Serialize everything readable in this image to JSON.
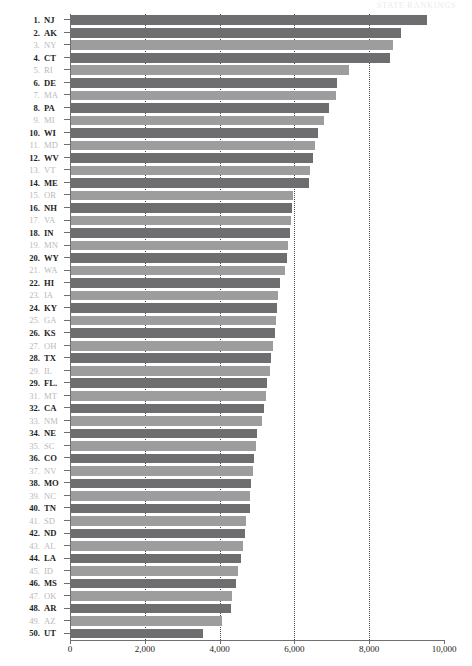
{
  "header": {
    "faint_text": "STATE RANKINGS"
  },
  "chart_data": {
    "type": "bar",
    "orientation": "horizontal",
    "title": "",
    "subtitle": "",
    "xlabel": "",
    "ylabel": "",
    "xlim": [
      0,
      10000
    ],
    "xticks": [
      0,
      2000,
      4000,
      6000,
      8000,
      10000
    ],
    "xticklabels": [
      "0",
      "2,000",
      "4,000",
      "6,000",
      "8,000",
      "10,000"
    ],
    "grid": "vertical-dotted",
    "legend": "none",
    "bar_colors": {
      "even_rank": "#6e6e70",
      "odd_rank": "#9d9d9e"
    },
    "categories": [
      "NJ",
      "AK",
      "NY",
      "CT",
      "RI",
      "DE",
      "MA",
      "PA",
      "MI",
      "WI",
      "MD",
      "WV",
      "VT",
      "ME",
      "OR",
      "NH",
      "VA",
      "IN",
      "MN",
      "WY",
      "WA",
      "HI",
      "IA",
      "KY",
      "GA",
      "KS",
      "OH",
      "TX",
      "IL",
      "FL",
      "MT",
      "CA",
      "NM",
      "NE",
      "SC",
      "CO",
      "NV",
      "MO",
      "NC",
      "TN",
      "SD",
      "ND",
      "AL",
      "LA",
      "ID",
      "MS",
      "OK",
      "AR",
      "AZ",
      "UT"
    ],
    "values": [
      9545,
      8850,
      8640,
      8545,
      7460,
      7140,
      7110,
      6930,
      6780,
      6620,
      6540,
      6500,
      6420,
      6380,
      5960,
      5940,
      5900,
      5890,
      5840,
      5790,
      5750,
      5620,
      5560,
      5540,
      5500,
      5470,
      5420,
      5370,
      5340,
      5280,
      5230,
      5190,
      5130,
      5000,
      4960,
      4920,
      4880,
      4850,
      4820,
      4800,
      4710,
      4680,
      4620,
      4560,
      4490,
      4440,
      4340,
      4310,
      4070,
      3560
    ],
    "ranks": [
      "1.",
      "2.",
      "3.",
      "4.",
      "5.",
      "6.",
      "7.",
      "8.",
      "9.",
      "10.",
      "11.",
      "12.",
      "13.",
      "14.",
      "15.",
      "16.",
      "17.",
      "18.",
      "19.",
      "20.",
      "21.",
      "22.",
      "23.",
      "24.",
      "25.",
      "26.",
      "27.",
      "28.",
      "29.",
      "29.",
      "31.",
      "32.",
      "33.",
      "34.",
      "35.",
      "36.",
      "37.",
      "38.",
      "39.",
      "40.",
      "41.",
      "42.",
      "43.",
      "44.",
      "45.",
      "46.",
      "47.",
      "48.",
      "49.",
      "50."
    ],
    "rows": [
      {
        "rank": "1.",
        "abbr": "NJ",
        "value": 9545,
        "emphasis": "bold"
      },
      {
        "rank": "2.",
        "abbr": "AK",
        "value": 8850,
        "emphasis": "bold"
      },
      {
        "rank": "3.",
        "abbr": "NY",
        "value": 8640,
        "emphasis": "light"
      },
      {
        "rank": "4.",
        "abbr": "CT",
        "value": 8545,
        "emphasis": "bold"
      },
      {
        "rank": "5.",
        "abbr": "RI",
        "value": 7460,
        "emphasis": "light"
      },
      {
        "rank": "6.",
        "abbr": "DE",
        "value": 7140,
        "emphasis": "bold"
      },
      {
        "rank": "7.",
        "abbr": "MA",
        "value": 7110,
        "emphasis": "light"
      },
      {
        "rank": "8.",
        "abbr": "PA",
        "value": 6930,
        "emphasis": "bold"
      },
      {
        "rank": "9.",
        "abbr": "MI",
        "value": 6780,
        "emphasis": "light"
      },
      {
        "rank": "10.",
        "abbr": "WI",
        "value": 6620,
        "emphasis": "bold"
      },
      {
        "rank": "11.",
        "abbr": "MD",
        "value": 6540,
        "emphasis": "light"
      },
      {
        "rank": "12.",
        "abbr": "WV",
        "value": 6500,
        "emphasis": "bold"
      },
      {
        "rank": "13.",
        "abbr": "VT",
        "value": 6420,
        "emphasis": "light"
      },
      {
        "rank": "14.",
        "abbr": "ME",
        "value": 6380,
        "emphasis": "bold"
      },
      {
        "rank": "15.",
        "abbr": "OR",
        "value": 5960,
        "emphasis": "light"
      },
      {
        "rank": "16.",
        "abbr": "NH",
        "value": 5940,
        "emphasis": "bold"
      },
      {
        "rank": "17.",
        "abbr": "VA",
        "value": 5900,
        "emphasis": "light"
      },
      {
        "rank": "18.",
        "abbr": "IN",
        "value": 5890,
        "emphasis": "bold"
      },
      {
        "rank": "19.",
        "abbr": "MN",
        "value": 5840,
        "emphasis": "light"
      },
      {
        "rank": "20.",
        "abbr": "WY",
        "value": 5790,
        "emphasis": "bold"
      },
      {
        "rank": "21.",
        "abbr": "WA",
        "value": 5750,
        "emphasis": "light"
      },
      {
        "rank": "22.",
        "abbr": "HI",
        "value": 5620,
        "emphasis": "bold"
      },
      {
        "rank": "23.",
        "abbr": "IA",
        "value": 5560,
        "emphasis": "light"
      },
      {
        "rank": "24.",
        "abbr": "KY",
        "value": 5540,
        "emphasis": "bold"
      },
      {
        "rank": "25.",
        "abbr": "GA",
        "value": 5500,
        "emphasis": "light"
      },
      {
        "rank": "26.",
        "abbr": "KS",
        "value": 5470,
        "emphasis": "bold"
      },
      {
        "rank": "27.",
        "abbr": "OH",
        "value": 5420,
        "emphasis": "light"
      },
      {
        "rank": "28.",
        "abbr": "TX",
        "value": 5370,
        "emphasis": "bold"
      },
      {
        "rank": "29.",
        "abbr": "IL",
        "value": 5340,
        "emphasis": "light"
      },
      {
        "rank": "29.",
        "abbr": "FL.",
        "value": 5280,
        "emphasis": "bold"
      },
      {
        "rank": "31.",
        "abbr": "MT",
        "value": 5230,
        "emphasis": "light"
      },
      {
        "rank": "32.",
        "abbr": "CA",
        "value": 5190,
        "emphasis": "bold"
      },
      {
        "rank": "33.",
        "abbr": "NM",
        "value": 5130,
        "emphasis": "light"
      },
      {
        "rank": "34.",
        "abbr": "NE",
        "value": 5000,
        "emphasis": "bold"
      },
      {
        "rank": "35.",
        "abbr": "SC",
        "value": 4960,
        "emphasis": "light"
      },
      {
        "rank": "36.",
        "abbr": "CO",
        "value": 4920,
        "emphasis": "bold"
      },
      {
        "rank": "37.",
        "abbr": "NV",
        "value": 4880,
        "emphasis": "light"
      },
      {
        "rank": "38.",
        "abbr": "MO",
        "value": 4850,
        "emphasis": "bold"
      },
      {
        "rank": "39.",
        "abbr": "NC",
        "value": 4820,
        "emphasis": "light"
      },
      {
        "rank": "40.",
        "abbr": "TN",
        "value": 4800,
        "emphasis": "bold"
      },
      {
        "rank": "41.",
        "abbr": "SD",
        "value": 4710,
        "emphasis": "light"
      },
      {
        "rank": "42.",
        "abbr": "ND",
        "value": 4680,
        "emphasis": "bold"
      },
      {
        "rank": "43.",
        "abbr": "AL",
        "value": 4620,
        "emphasis": "light"
      },
      {
        "rank": "44.",
        "abbr": "LA",
        "value": 4560,
        "emphasis": "bold"
      },
      {
        "rank": "45.",
        "abbr": "ID",
        "value": 4490,
        "emphasis": "light"
      },
      {
        "rank": "46.",
        "abbr": "MS",
        "value": 4440,
        "emphasis": "bold"
      },
      {
        "rank": "47.",
        "abbr": "OK",
        "value": 4340,
        "emphasis": "light"
      },
      {
        "rank": "48.",
        "abbr": "AR",
        "value": 4310,
        "emphasis": "bold"
      },
      {
        "rank": "49.",
        "abbr": "AZ",
        "value": 4070,
        "emphasis": "light"
      },
      {
        "rank": "50.",
        "abbr": "UT",
        "value": 3560,
        "emphasis": "bold"
      }
    ]
  }
}
